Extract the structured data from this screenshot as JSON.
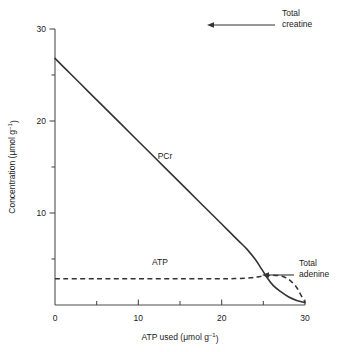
{
  "chart_data": {
    "type": "line",
    "title": "",
    "subtitle": "",
    "xlabel": "ATP used (μmol g",
    "xlabel_exponent": "−1",
    "xlabel_close": ")",
    "ylabel": "Concentration (μmol g",
    "ylabel_exponent": "−1",
    "ylabel_close": ")",
    "xlim": [
      0,
      30
    ],
    "ylim": [
      0,
      30
    ],
    "grid": false,
    "legend_position": "inline-labels",
    "x_major_ticks": [
      0,
      10,
      20,
      30
    ],
    "x_major_tick_labels": [
      "0",
      "10",
      "20",
      "30"
    ],
    "x_minor_ticks": [
      5,
      15,
      25
    ],
    "y_major_ticks": [
      10,
      20,
      30
    ],
    "y_major_tick_labels": [
      "10",
      "20",
      "30"
    ],
    "y_minor_ticks": [
      5,
      15,
      25
    ],
    "series": [
      {
        "name": "PCr",
        "style": "solid",
        "label": "PCr",
        "label_x": 13.2,
        "label_y": 15.9,
        "x": [
          0,
          2,
          4,
          6,
          8,
          10,
          12,
          14,
          16,
          18,
          20,
          22,
          23,
          24,
          24.8,
          25.5,
          26.2,
          27,
          28,
          29,
          30
        ],
        "values": [
          26.8,
          25.0,
          23.2,
          21.4,
          19.6,
          17.8,
          16.0,
          14.2,
          12.4,
          10.6,
          8.8,
          7.0,
          6.1,
          5.0,
          3.9,
          2.9,
          2.1,
          1.5,
          0.9,
          0.5,
          0.25
        ]
      },
      {
        "name": "Total adenine",
        "style": "dashed",
        "label": "ATP",
        "label_x": 12.6,
        "label_y": 4.4,
        "x": [
          0,
          5,
          10,
          15,
          20,
          22,
          23.5,
          24.5,
          25.5,
          26.5,
          27.5,
          28.3,
          29,
          29.5,
          30
        ],
        "values": [
          2.85,
          2.85,
          2.85,
          2.85,
          2.85,
          2.88,
          2.95,
          3.08,
          3.2,
          3.22,
          3.05,
          2.6,
          1.9,
          1.1,
          0.3
        ]
      }
    ],
    "annotations": [
      {
        "id": "total-creatine",
        "line1": "Total",
        "line2": "creatine",
        "text_x": 282,
        "text_y": 16,
        "arrow_from_x": 275,
        "arrow_from_y": 25,
        "arrow_to_x": 207,
        "arrow_to_y": 25
      },
      {
        "id": "total-adenine",
        "line1": "Total",
        "line2": "adenine",
        "text_x": 299,
        "text_y": 266,
        "arrow_from_x": 294,
        "arrow_from_y": 275,
        "arrow_to_x": 262,
        "arrow_to_y": 275
      }
    ],
    "colors": {
      "series_stroke": "#333333",
      "axis": "#4d4d4d",
      "text": "#1a1a1a",
      "background": "#ffffff"
    }
  },
  "geometry": {
    "plot_left": 55,
    "plot_right": 305,
    "plot_top": 29,
    "plot_bottom": 305
  }
}
